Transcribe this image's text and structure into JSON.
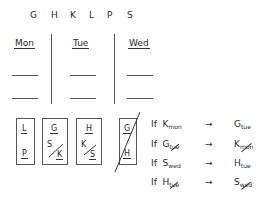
{
  "variables": [
    "G",
    "H",
    "K",
    "L",
    "P",
    "S"
  ],
  "days": [
    {
      "label": "Mon",
      "slots": 2
    },
    {
      "label": "Tue",
      "slots": 2
    },
    {
      "label": "Wed",
      "slots": 2
    }
  ],
  "scenario_boxes": [
    {
      "top": "L",
      "bottom": "P",
      "crossed": false
    },
    {
      "top": "G",
      "bottom_a": "S",
      "bottom_b": "K",
      "crossed": false
    },
    {
      "top": "H",
      "bottom_a": "K",
      "bottom_b": "S",
      "crossed": false
    },
    {
      "top": "G",
      "bottom": "H",
      "crossed": true
    }
  ],
  "rules": [
    {
      "prefix": "If",
      "left": "K",
      "left_sub": "mon",
      "left_neg": false,
      "arrow": "→",
      "right": "G",
      "right_sub": "tue",
      "right_neg": false
    },
    {
      "prefix": "If",
      "left": "G",
      "left_sub": "tue",
      "left_neg": true,
      "arrow": "→",
      "right": "K",
      "right_sub": "mon",
      "right_neg": true
    },
    {
      "prefix": "If",
      "left": "S",
      "left_sub": "wed",
      "left_neg": false,
      "arrow": "→",
      "right": "H",
      "right_sub": "tue",
      "right_neg": false
    },
    {
      "prefix": "If",
      "left": "H",
      "left_sub": "tue",
      "left_neg": true,
      "arrow": "→",
      "right": "S",
      "right_sub": "wed",
      "right_neg": true
    }
  ]
}
